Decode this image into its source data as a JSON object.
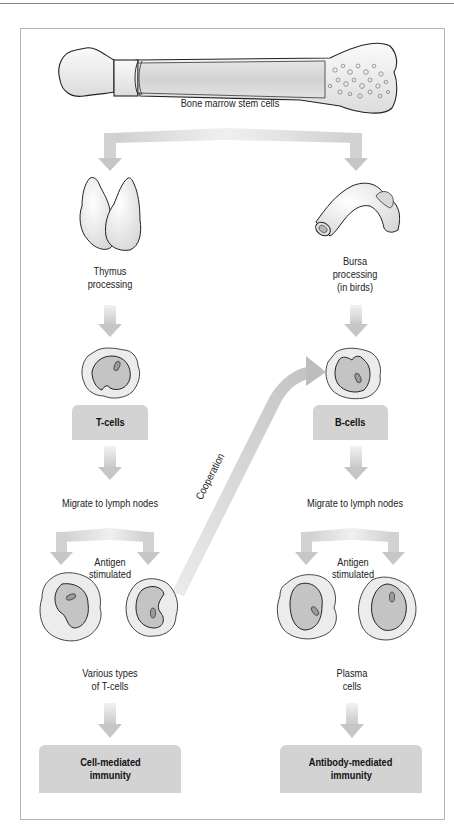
{
  "diagram": {
    "colors": {
      "arrow": "#cfcfcf",
      "box": "#d3d3d3",
      "cell_outer": "#ececec",
      "cell_inner": "#c4c4c4",
      "outline": "#333333",
      "frame": "#b5b5b5"
    },
    "source": {
      "icon": "bone-icon",
      "label": "Bone marrow stem cells"
    },
    "left_branch": {
      "organ_icon": "thymus-icon",
      "organ_label_1": "Thymus",
      "organ_label_2": "processing",
      "cell_icon": "t-cell-icon",
      "cell_box": "T-cells",
      "migrate": "Migrate to lymph nodes",
      "antigen_1": "Antigen",
      "antigen_2": "stimulated",
      "result_label_1": "Various types",
      "result_label_2": "of T-cells",
      "outcome_1": "Cell-mediated",
      "outcome_2": "immunity"
    },
    "right_branch": {
      "organ_icon": "bursa-icon",
      "organ_label_1": "Bursa",
      "organ_label_2": "processing",
      "organ_label_3": "(in birds)",
      "cell_icon": "b-cell-icon",
      "cell_box": "B-cells",
      "migrate": "Migrate to lymph nodes",
      "antigen_1": "Antigen",
      "antigen_2": "stimulated",
      "result_label_1": "Plasma",
      "result_label_2": "cells",
      "outcome_1": "Antibody-mediated",
      "outcome_2": "immunity"
    },
    "cross_link": {
      "label": "Cooperation",
      "from": "T-cells (antigen stimulated)",
      "to": "B-cells"
    }
  }
}
